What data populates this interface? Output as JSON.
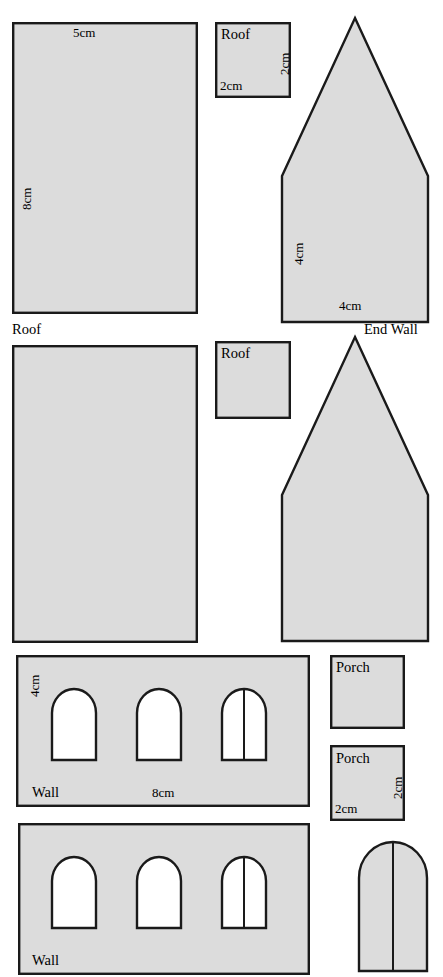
{
  "sheet": {
    "title": "Model building cut-out template sheet",
    "background_color": "#ffffff",
    "piece_fill_color": "#dcdcdc",
    "outline_color": "#1a1a1a",
    "hole_fill_color": "#ffffff"
  },
  "pieces": {
    "roof_large_top": {
      "name": "Roof",
      "shape": "rectangle",
      "label": "Roof",
      "width_label": "5cm",
      "height_label": "8cm"
    },
    "roof_small_top": {
      "name": "Roof",
      "shape": "square",
      "label": "Roof",
      "width_label": "2cm",
      "height_label": "2cm"
    },
    "end_wall_top": {
      "name": "End Wall",
      "shape": "pentagon-house",
      "label": "End Wall",
      "width_label": "4cm",
      "height_label": "4cm"
    },
    "roof_large_mid": {
      "name": "Roof",
      "shape": "rectangle",
      "label": "Roof"
    },
    "roof_small_mid": {
      "name": "Roof",
      "shape": "square",
      "label": "Roof"
    },
    "end_wall_mid": {
      "name": "End Wall",
      "shape": "pentagon-house",
      "label": ""
    },
    "wall_top": {
      "name": "Wall",
      "shape": "rectangle-with-3-arch-openings",
      "label": "Wall",
      "width_label": "8cm",
      "height_label": "4cm",
      "openings": 3,
      "door_opening_index": 3
    },
    "wall_bottom": {
      "name": "Wall",
      "shape": "rectangle-with-3-arch-openings",
      "label": "Wall",
      "openings": 3,
      "door_opening_index": 3
    },
    "porch_upper": {
      "name": "Porch",
      "shape": "square",
      "label": "Porch"
    },
    "porch_lower": {
      "name": "Porch",
      "shape": "square",
      "label": "Porch",
      "width_label": "2cm",
      "height_label": "2cm"
    },
    "door_arch": {
      "name": "Door",
      "shape": "arch-with-center-split",
      "label": ""
    }
  }
}
